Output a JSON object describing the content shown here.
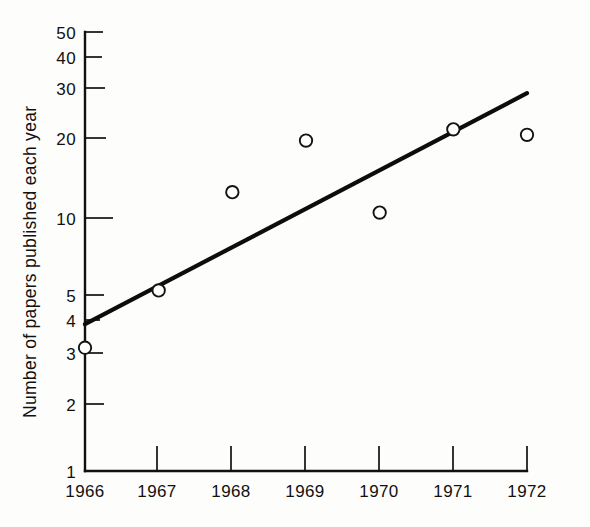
{
  "chart_data": {
    "type": "scatter",
    "title": "",
    "xlabel": "",
    "ylabel": "Number of papers published each year",
    "x": [
      1966,
      1967,
      1968,
      1969,
      1970,
      1971,
      1972
    ],
    "categories": [
      "1966",
      "1967",
      "1968",
      "1969",
      "1970",
      "1971",
      "1972"
    ],
    "values": [
      3,
      5,
      12,
      19,
      10,
      21,
      20
    ],
    "series": [
      {
        "name": "Papers published",
        "marker": "open-circle",
        "values": [
          3,
          5,
          12,
          19,
          10,
          21,
          20
        ]
      },
      {
        "name": "Fitted trend line",
        "type": "line",
        "x": [
          1966,
          1972
        ],
        "values": [
          3.7,
          29
        ]
      }
    ],
    "yscale": "log",
    "ylim": [
      1,
      50
    ],
    "xlim": [
      1966,
      1972
    ],
    "grid": false,
    "legend": false,
    "y_tick_labels": [
      "1",
      "2",
      "3",
      "4",
      "5",
      "10",
      "20",
      "30",
      "40",
      "50"
    ],
    "y_tick_values": [
      1,
      2,
      3,
      4,
      5,
      10,
      20,
      30,
      40,
      50
    ],
    "x_tick_labels": [
      "1966",
      "1967",
      "1968",
      "1969",
      "1970",
      "1971",
      "1972"
    ],
    "annotations": []
  },
  "axes": {
    "y_axis_label": "Number of papers published each year",
    "y_ticks": [
      {
        "label": "50",
        "value": 50
      },
      {
        "label": "40",
        "value": 40
      },
      {
        "label": "30",
        "value": 30
      },
      {
        "label": "20",
        "value": 20
      },
      {
        "label": "10",
        "value": 10
      },
      {
        "label": "5",
        "value": 5
      },
      {
        "label": "4",
        "value": 4
      },
      {
        "label": "3",
        "value": 3
      },
      {
        "label": "2",
        "value": 2
      },
      {
        "label": "1",
        "value": 1
      }
    ],
    "x_ticks": [
      {
        "label": "1966",
        "value": 1966
      },
      {
        "label": "1967",
        "value": 1967
      },
      {
        "label": "1968",
        "value": 1968
      },
      {
        "label": "1969",
        "value": 1969
      },
      {
        "label": "1970",
        "value": 1970
      },
      {
        "label": "1971",
        "value": 1971
      },
      {
        "label": "1972",
        "value": 1972
      }
    ]
  },
  "colors": {
    "ink": "#111111",
    "background": "#fdfdfb",
    "marker_fill": "#ffffff"
  }
}
